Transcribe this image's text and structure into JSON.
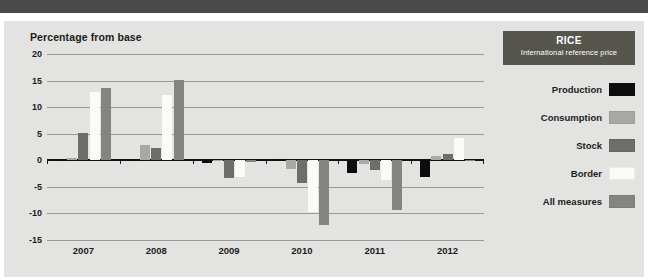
{
  "banner": {
    "name": "top-banner",
    "color": "#4a4a4a"
  },
  "panel": {
    "background": "#e3e3e1"
  },
  "legend": {
    "title": "RICE",
    "subtitle": "International reference price",
    "header_color": "#56564f",
    "items": [
      {
        "label": "Production",
        "color": "#0d0d0d"
      },
      {
        "label": "Consumption",
        "color": "#a8a8a4"
      },
      {
        "label": "Stock",
        "color": "#6e6e68"
      },
      {
        "label": "Border",
        "color": "#fafaf7"
      },
      {
        "label": "All measures",
        "color": "#848480"
      }
    ]
  },
  "chart_data": {
    "type": "bar",
    "title": "Percentage from base",
    "xlabel": "",
    "ylabel": "Percentage from base",
    "categories": [
      "2007",
      "2008",
      "2009",
      "2010",
      "2011",
      "2012"
    ],
    "ylim": [
      -15,
      20
    ],
    "yticks": [
      20,
      15,
      10,
      5,
      0,
      -5,
      -10,
      -15
    ],
    "ytick_labels": [
      "20",
      "15",
      "10",
      "5",
      "0",
      "-5",
      "-10",
      "-15"
    ],
    "grid": true,
    "legend_position": "right",
    "series": [
      {
        "name": "Production",
        "color": "#0d0d0d",
        "values": [
          0.1,
          0.1,
          -0.6,
          0.2,
          -2.3,
          -3.1
        ]
      },
      {
        "name": "Consumption",
        "color": "#a8a8a4",
        "values": [
          0.5,
          2.9,
          -0.2,
          -1.6,
          -0.7,
          0.8
        ]
      },
      {
        "name": "Stock",
        "color": "#6e6e68",
        "values": [
          5.1,
          2.3,
          -3.4,
          -4.2,
          -1.8,
          1.1
        ]
      },
      {
        "name": "Border",
        "color": "#fafaf7",
        "values": [
          12.9,
          12.3,
          -3.1,
          -9.7,
          -3.7,
          4.1
        ]
      },
      {
        "name": "All measures",
        "color": "#848480",
        "values": [
          13.6,
          15.1,
          -0.3,
          -12.1,
          -9.4,
          -0.2
        ]
      }
    ]
  }
}
